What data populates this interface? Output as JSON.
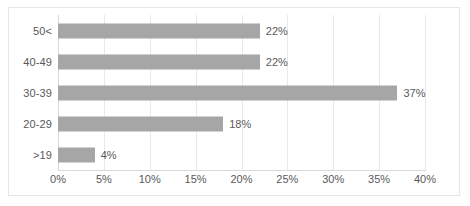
{
  "chart_data": {
    "type": "bar",
    "orientation": "horizontal",
    "title": "",
    "xlabel": "",
    "ylabel": "",
    "categories": [
      "50<",
      "40-49",
      "30-39",
      "20-29",
      ">19"
    ],
    "values": [
      22,
      22,
      37,
      18,
      4
    ],
    "data_labels": [
      "22%",
      "22%",
      "37%",
      "18%",
      "4%"
    ],
    "xlim": [
      0,
      40
    ],
    "xticks": [
      0,
      5,
      10,
      15,
      20,
      25,
      30,
      35,
      40
    ],
    "xtick_labels": [
      "0%",
      "5%",
      "10%",
      "15%",
      "20%",
      "25%",
      "30%",
      "35%",
      "40%"
    ],
    "grid": "vertical",
    "legend": "none",
    "colors": {
      "bar": "#a6a6a6",
      "text": "#595959",
      "gridline": "#e8e8e8",
      "frame": "#e6e6e6",
      "background": "#ffffff"
    }
  }
}
